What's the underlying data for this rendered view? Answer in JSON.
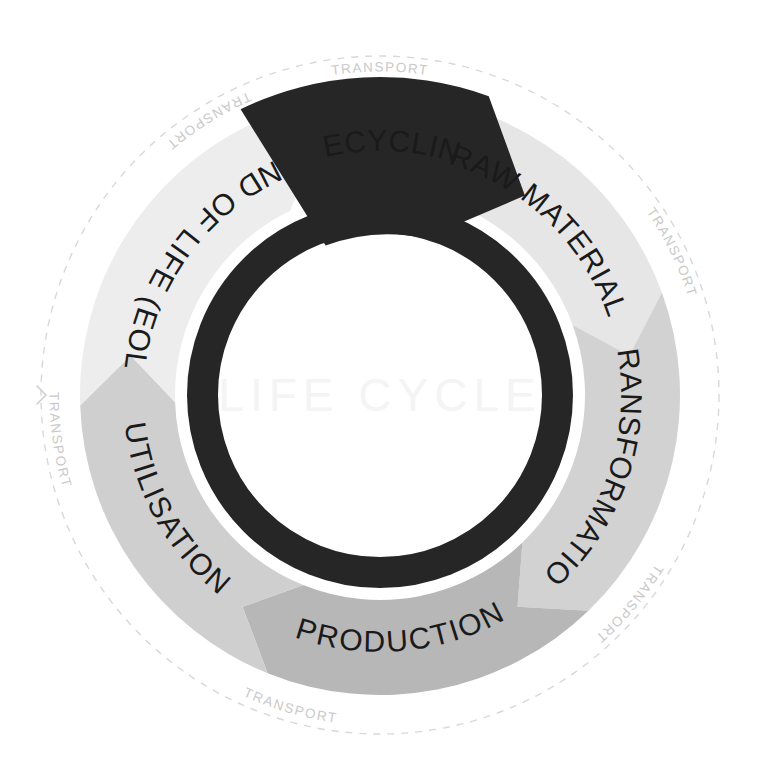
{
  "diagram": {
    "title": "LIFE CYCLE",
    "center_watermark": "LIFE CYCLE",
    "type": "circular-lifecycle-wheel",
    "direction": "clockwise",
    "background_color": "#ffffff",
    "inner_ring_color": "#262626",
    "dashed_ring_color": "#d8d8d8",
    "center_text_color": "#f4f4f4",
    "label_text_color": "#1a1a1a",
    "transport_text_color": "#c9c9c9"
  },
  "stages": [
    {
      "id": "raw-material",
      "label": "RAW MATERIAL",
      "fill": "#e6e6e6",
      "start_angle": -84,
      "end_angle": -20,
      "text_color": "#1a1a1a",
      "order": 1
    },
    {
      "id": "transformation",
      "label": "TRANSFORMATION",
      "fill": "#d2d2d2",
      "start_angle": -20,
      "end_angle": 46,
      "text_color": "#1a1a1a",
      "order": 2
    },
    {
      "id": "production",
      "label": "PRODUCTION",
      "fill": "#b7b7b7",
      "start_angle": 46,
      "end_angle": 112,
      "text_color": "#1a1a1a",
      "order": 3
    },
    {
      "id": "utilisation",
      "label": "UTILISATION",
      "fill": "#cfcfcf",
      "start_angle": 112,
      "end_angle": 178,
      "text_color": "#1a1a1a",
      "order": 4
    },
    {
      "id": "end-of-life",
      "label": "END OF LIFE (EOL)",
      "fill": "#ededed",
      "start_angle": 178,
      "end_angle": 244,
      "text_color": "#1a1a1a",
      "order": 5
    },
    {
      "id": "recycling",
      "label": "RECYCLING",
      "fill": "#262626",
      "start_angle": 244,
      "end_angle": 290,
      "text_color": "#1a1a1a",
      "order": 6
    }
  ],
  "transport_markers": [
    {
      "id": "transport-top",
      "label": "TRANSPORT",
      "angle": -90
    },
    {
      "id": "transport-upper-right",
      "label": "TRANSPORT",
      "angle": -26
    },
    {
      "id": "transport-lower-right",
      "label": "TRANSPORT",
      "angle": 40
    },
    {
      "id": "transport-bottom",
      "label": "TRANSPORT",
      "angle": 106
    },
    {
      "id": "transport-lower-left",
      "label": "TRANSPORT",
      "angle": 172
    },
    {
      "id": "transport-upper-left",
      "label": "TRANSPORT",
      "angle": 238
    }
  ],
  "geometry": {
    "center_x": 380,
    "center_y": 395,
    "dashed_radius": 339,
    "outer_radius": 300,
    "inner_radius": 205,
    "ring_outer_radius": 193,
    "ring_inner_radius": 162,
    "arrow_tip_radius": 175,
    "arrow_back_radius": 318
  }
}
